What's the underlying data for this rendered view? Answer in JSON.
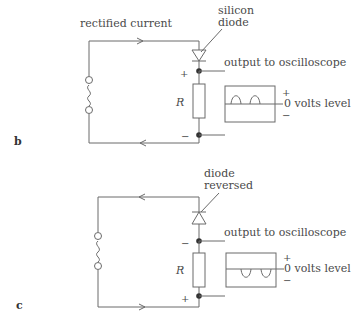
{
  "diagrams": [
    {
      "id": "b",
      "panel_label": "b",
      "title_label": "rectified current",
      "diode_label_line1": "silicon",
      "diode_label_line2": "diode",
      "output_label": "output to oscilloscope",
      "resistor_label": "R",
      "top_node_sign": "+",
      "bottom_node_sign": "−",
      "scope_plus": "+",
      "scope_zero_label": "0 volts level",
      "scope_minus": "−",
      "diode_orientation": "forward",
      "waveform": "positive half-cycles",
      "source_icon": "ac-source-icon",
      "top_arrow_direction": "right",
      "bottom_arrow_direction": "left"
    },
    {
      "id": "c",
      "panel_label": "c",
      "diode_label_line1": "diode",
      "diode_label_line2": "reversed",
      "output_label": "output to oscilloscope",
      "resistor_label": "R",
      "top_node_sign": "−",
      "bottom_node_sign": "+",
      "scope_plus": "+",
      "scope_zero_label": "0 volts level",
      "scope_minus": "−",
      "diode_orientation": "reversed",
      "waveform": "negative half-cycles",
      "source_icon": "ac-source-icon",
      "top_arrow_direction": "left",
      "bottom_arrow_direction": "right"
    }
  ],
  "colors": {
    "line": "#6a6a6a",
    "text": "#4a4a4a",
    "background": "#ffffff"
  }
}
